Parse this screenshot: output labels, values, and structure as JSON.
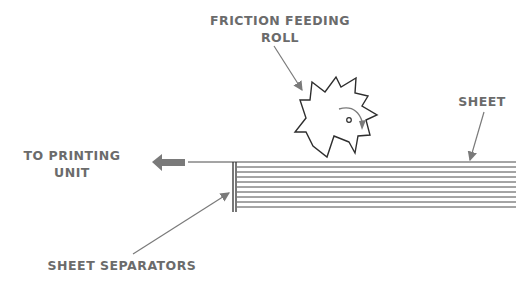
{
  "diagram": {
    "labels": {
      "roll_line1": "FRICTION  FEEDING",
      "roll_line2": "ROLL",
      "sheet": "SHEET",
      "to_printing_line1": "TO  PRINTING",
      "to_printing_line2": "UNIT",
      "separators": "SHEET  SEPARATORS"
    },
    "components": [
      "friction-feeding-roll",
      "sheet-stack",
      "sheet-separators",
      "output-arrow"
    ],
    "colors": {
      "line": "#3a3a3a",
      "label": "#6b6b6b",
      "arrow": "#7a7a7a"
    }
  }
}
